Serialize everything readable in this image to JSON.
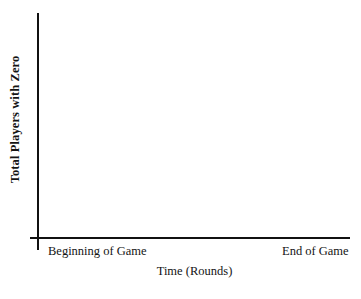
{
  "chart_data": {
    "type": "line",
    "title": "",
    "subtitle": "",
    "xlabel": "Time (Rounds)",
    "ylabel": "Total Players with Zero",
    "x_tick_labels": [
      "Beginning of Game",
      "End of Game"
    ],
    "y_tick_labels": [],
    "series": [],
    "values": [],
    "categories": [],
    "xlim": null,
    "ylim": null,
    "grid": false,
    "legend": false,
    "legend_position": "none",
    "annotations": [],
    "note": "Blank axes template: axes drawn with no plotted data."
  },
  "figure": {
    "background_color": "#ffffff",
    "axis_color": "#111111",
    "text_color": "#141414",
    "y_axis_label": "Total Players with Zero",
    "x_axis_title": "Time (Rounds)",
    "x_tick_start_label": "Beginning of Game",
    "x_tick_end_label": "End of Game"
  }
}
